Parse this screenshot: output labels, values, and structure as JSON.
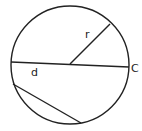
{
  "diagram": {
    "labels": {
      "radius": "r",
      "diameter": "d",
      "circumference": "C"
    },
    "stroke_color": "#222222",
    "background": "#ffffff"
  }
}
